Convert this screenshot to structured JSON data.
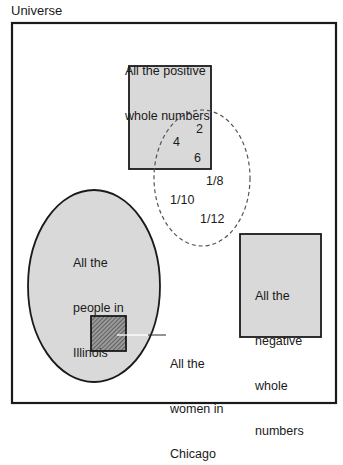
{
  "title": "Universe",
  "colors": {
    "fill_gray": "#d9d9d9",
    "stroke": "#1a1a1a",
    "dashed": "#555555",
    "hatch_bg": "#9a9a9a",
    "hatch_line": "#3a3a3a",
    "leader": "#ffffff"
  },
  "sets": {
    "positive_whole_numbers": {
      "label_line1": "All the positive",
      "label_line2": "whole numbers"
    },
    "negative_whole_numbers": {
      "label_line1": "All the",
      "label_line2": "negative",
      "label_line3": "whole",
      "label_line4": "numbers"
    },
    "people_in_illinois": {
      "label_line1": "All the",
      "label_line2": "people in",
      "label_line3": "Illinois"
    },
    "women_in_chicago": {
      "label_line1": "All the",
      "label_line2": "women in",
      "label_line3": "Chicago"
    },
    "dashed_set": {
      "elements": [
        "2",
        "4",
        "6",
        "1/8",
        "1/10",
        "1/12"
      ]
    }
  }
}
